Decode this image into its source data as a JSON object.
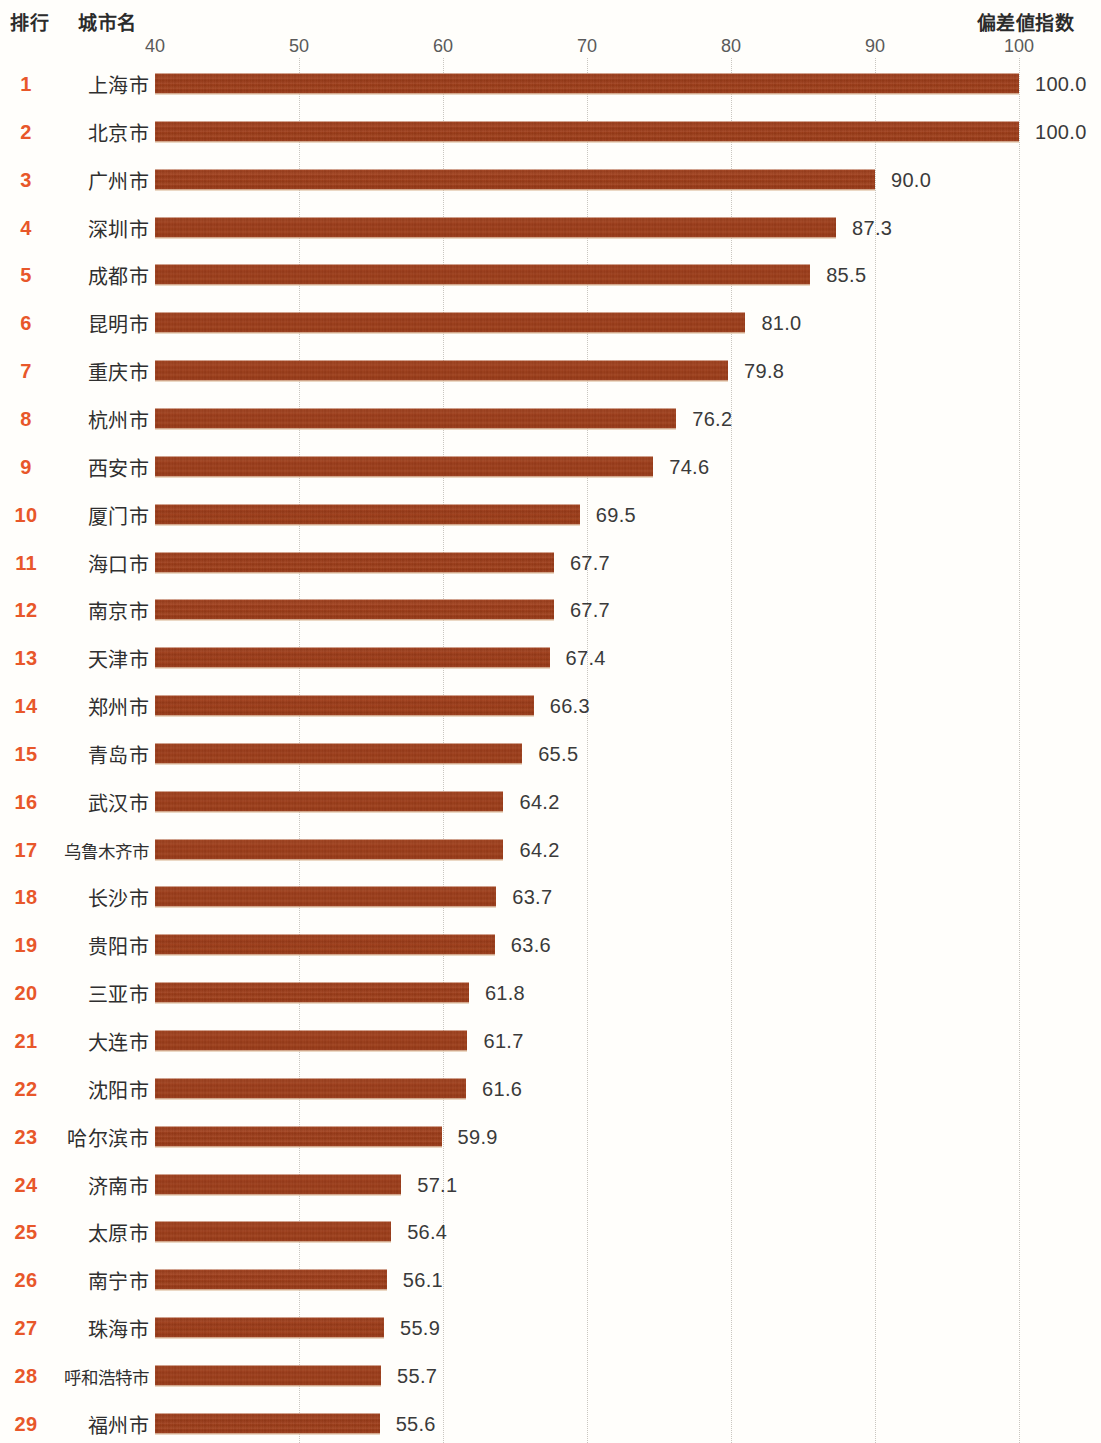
{
  "header": {
    "rank_label": "排行",
    "city_label": "城市名",
    "index_label": "偏差値指数"
  },
  "chart_data": {
    "type": "bar",
    "orientation": "horizontal",
    "title": "",
    "xlabel": "偏差値指数",
    "ylabel": "城市名",
    "xlim": [
      40,
      100
    ],
    "ticks": [
      40,
      50,
      60,
      70,
      80,
      90,
      100
    ],
    "tick_labels": [
      "40",
      "50",
      "60",
      "70",
      "80",
      "90",
      "100"
    ],
    "grid": true,
    "legend": "none",
    "bar_color": "#9d3a16",
    "rank_color": "#e8572a",
    "categories": [
      "上海市",
      "北京市",
      "广州市",
      "深圳市",
      "成都市",
      "昆明市",
      "重庆市",
      "杭州市",
      "西安市",
      "厦门市",
      "海口市",
      "南京市",
      "天津市",
      "郑州市",
      "青岛市",
      "武汉市",
      "乌鲁木齐市",
      "长沙市",
      "贵阳市",
      "三亚市",
      "大连市",
      "沈阳市",
      "哈尔滨市",
      "济南市",
      "太原市",
      "南宁市",
      "珠海市",
      "呼和浩特市",
      "福州市",
      "南昌市"
    ],
    "values": [
      100.0,
      100.0,
      90.0,
      87.3,
      85.5,
      81.0,
      79.8,
      76.2,
      74.6,
      69.5,
      67.7,
      67.7,
      67.4,
      66.3,
      65.5,
      64.2,
      64.2,
      63.7,
      63.6,
      61.8,
      61.7,
      61.6,
      59.9,
      57.1,
      56.4,
      56.1,
      55.9,
      55.7,
      55.6,
      55.4
    ]
  },
  "rows": [
    {
      "rank": "1",
      "city": "上海市",
      "value": 100.0,
      "value_label": "100.0"
    },
    {
      "rank": "2",
      "city": "北京市",
      "value": 100.0,
      "value_label": "100.0"
    },
    {
      "rank": "3",
      "city": "广州市",
      "value": 90.0,
      "value_label": "90.0"
    },
    {
      "rank": "4",
      "city": "深圳市",
      "value": 87.3,
      "value_label": "87.3"
    },
    {
      "rank": "5",
      "city": "成都市",
      "value": 85.5,
      "value_label": "85.5"
    },
    {
      "rank": "6",
      "city": "昆明市",
      "value": 81.0,
      "value_label": "81.0"
    },
    {
      "rank": "7",
      "city": "重庆市",
      "value": 79.8,
      "value_label": "79.8"
    },
    {
      "rank": "8",
      "city": "杭州市",
      "value": 76.2,
      "value_label": "76.2"
    },
    {
      "rank": "9",
      "city": "西安市",
      "value": 74.6,
      "value_label": "74.6"
    },
    {
      "rank": "10",
      "city": "厦门市",
      "value": 69.5,
      "value_label": "69.5"
    },
    {
      "rank": "11",
      "city": "海口市",
      "value": 67.7,
      "value_label": "67.7"
    },
    {
      "rank": "12",
      "city": "南京市",
      "value": 67.7,
      "value_label": "67.7"
    },
    {
      "rank": "13",
      "city": "天津市",
      "value": 67.4,
      "value_label": "67.4"
    },
    {
      "rank": "14",
      "city": "郑州市",
      "value": 66.3,
      "value_label": "66.3"
    },
    {
      "rank": "15",
      "city": "青岛市",
      "value": 65.5,
      "value_label": "65.5"
    },
    {
      "rank": "16",
      "city": "武汉市",
      "value": 64.2,
      "value_label": "64.2"
    },
    {
      "rank": "17",
      "city": "乌鲁木齐市",
      "value": 64.2,
      "value_label": "64.2"
    },
    {
      "rank": "18",
      "city": "长沙市",
      "value": 63.7,
      "value_label": "63.7"
    },
    {
      "rank": "19",
      "city": "贵阳市",
      "value": 63.6,
      "value_label": "63.6"
    },
    {
      "rank": "20",
      "city": "三亚市",
      "value": 61.8,
      "value_label": "61.8"
    },
    {
      "rank": "21",
      "city": "大连市",
      "value": 61.7,
      "value_label": "61.7"
    },
    {
      "rank": "22",
      "city": "沈阳市",
      "value": 61.6,
      "value_label": "61.6"
    },
    {
      "rank": "23",
      "city": "哈尔滨市",
      "value": 59.9,
      "value_label": "59.9"
    },
    {
      "rank": "24",
      "city": "济南市",
      "value": 57.1,
      "value_label": "57.1"
    },
    {
      "rank": "25",
      "city": "太原市",
      "value": 56.4,
      "value_label": "56.4"
    },
    {
      "rank": "26",
      "city": "南宁市",
      "value": 56.1,
      "value_label": "56.1"
    },
    {
      "rank": "27",
      "city": "珠海市",
      "value": 55.9,
      "value_label": "55.9"
    },
    {
      "rank": "28",
      "city": "呼和浩特市",
      "value": 55.7,
      "value_label": "55.7"
    },
    {
      "rank": "29",
      "city": "福州市",
      "value": 55.6,
      "value_label": "55.6"
    },
    {
      "rank": "30",
      "city": "南昌市",
      "value": 55.4,
      "value_label": "55.4"
    }
  ]
}
